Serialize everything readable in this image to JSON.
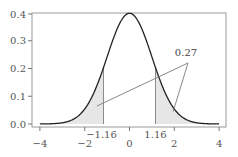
{
  "chart_data": {
    "type": "area",
    "title": "",
    "xlabel": "",
    "ylabel": "",
    "xlim": [
      -4.3,
      4.3
    ],
    "ylim": [
      0.0,
      0.4
    ],
    "grid": false,
    "legend": null,
    "series": [
      {
        "name": "Standard normal density",
        "function": "exp(-x^2/2)/sqrt(2*pi)",
        "x": [
          -4,
          -3,
          -2,
          -1.16,
          -1,
          0,
          1,
          1.16,
          2,
          3,
          4
        ],
        "y": [
          0.0001,
          0.0044,
          0.054,
          0.2036,
          0.242,
          0.3989,
          0.242,
          0.2036,
          0.054,
          0.0044,
          0.0001
        ],
        "color": "#222222"
      }
    ],
    "shaded_regions": [
      {
        "from": -4,
        "to": -1.16,
        "color": "#e6e6e6"
      },
      {
        "from": 1.16,
        "to": 4,
        "color": "#e6e6e6"
      }
    ],
    "x_ticks": [
      {
        "value": -4,
        "label": "−4"
      },
      {
        "value": -2,
        "label": "−2"
      },
      {
        "value": 0,
        "label": "0"
      },
      {
        "value": 2,
        "label": "2"
      },
      {
        "value": 4,
        "label": "4"
      }
    ],
    "x_marks": [
      {
        "value": -1.16,
        "label": "−1.16"
      },
      {
        "value": 1.16,
        "label": "1.16"
      }
    ],
    "y_ticks": [
      {
        "value": 0.0,
        "label": "0.0"
      },
      {
        "value": 0.1,
        "label": "0.1"
      },
      {
        "value": 0.2,
        "label": "0.2"
      },
      {
        "value": 0.3,
        "label": "0.3"
      },
      {
        "value": 0.4,
        "label": "0.4"
      }
    ],
    "annotations": [
      {
        "text": "0.27",
        "meaning": "combined shaded tail area",
        "points_to": [
          [
            -1.45,
            0.065
          ],
          [
            1.95,
            0.045
          ]
        ]
      }
    ]
  },
  "layout": {
    "frame": {
      "left": 32,
      "top": 13,
      "right": 226,
      "bottom": 127
    },
    "x_px_zero": 129.5,
    "x_px_per_unit": 22.4,
    "y_px_zero": 124,
    "y_px_per_unit": 277.5,
    "annot_label_pos": [
      186,
      56
    ],
    "annot_origin": [
      188,
      63
    ]
  }
}
